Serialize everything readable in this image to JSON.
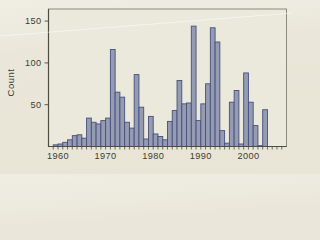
{
  "figure": {
    "background": "#eae7da",
    "plot_background": "#ebe9dc",
    "axis_color": "#4c4c41",
    "frame_color": "#8b8b7d",
    "text_color": "#3b3b33",
    "bar_fill": "#949bb2",
    "bar_stroke": "#47507a"
  },
  "chart_data": {
    "type": "bar",
    "title": "",
    "xlabel": "",
    "ylabel": "Count",
    "grid": "off",
    "legend": "none",
    "x_axis_range": [
      1958,
      2007
    ],
    "ylim": [
      0,
      164
    ],
    "yticks": [
      50,
      100,
      150
    ],
    "x_tick_labels": [
      "1960",
      "1970",
      "1980",
      "1990",
      "2000"
    ],
    "x_tick_label_years": [
      1960,
      1970,
      1980,
      1990,
      2000
    ],
    "bin_width_years": 1,
    "categories": [
      1959,
      1960,
      1961,
      1962,
      1963,
      1964,
      1965,
      1966,
      1967,
      1968,
      1969,
      1970,
      1971,
      1972,
      1973,
      1974,
      1975,
      1976,
      1977,
      1978,
      1979,
      1980,
      1981,
      1982,
      1983,
      1984,
      1985,
      1986,
      1987,
      1988,
      1989,
      1990,
      1991,
      1992,
      1993,
      1994,
      1995,
      1996,
      1997,
      1998,
      1999,
      2000,
      2001,
      2002,
      2003,
      2004,
      2005,
      2006
    ],
    "values": [
      2,
      3,
      5,
      8,
      13,
      14,
      10,
      34,
      29,
      27,
      31,
      34,
      116,
      65,
      59,
      29,
      22,
      86,
      47,
      9,
      36,
      15,
      12,
      8,
      30,
      43,
      79,
      51,
      52,
      144,
      31,
      51,
      75,
      142,
      125,
      19,
      4,
      53,
      67,
      3,
      88,
      53,
      25,
      1,
      44,
      0,
      0,
      0
    ]
  }
}
